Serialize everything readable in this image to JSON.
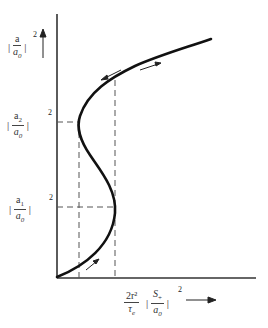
{
  "diagram": {
    "type": "bistability-hysteresis-curve",
    "y_axis_label": {
      "num": "a",
      "den": "a0",
      "den_base": "a",
      "den_sub": "0",
      "power": "2"
    },
    "y_ticks": [
      {
        "id": "a2",
        "num_base": "a",
        "num_sub": "2",
        "den_base": "a",
        "den_sub": "0",
        "power": "2"
      },
      {
        "id": "a1",
        "num_base": "a",
        "num_sub": "1",
        "den_base": "a",
        "den_sub": "0",
        "power": "2"
      }
    ],
    "x_axis_label": {
      "coef_num": "2r²",
      "coef_den_base": "τ",
      "coef_den_sub": "e",
      "frac_num_base": "S",
      "frac_num_sub": "+",
      "frac_den_base": "a",
      "frac_den_sub": "0",
      "power": "2"
    },
    "colors": {
      "curve": "#111111",
      "axis": "#333333",
      "dashed": "#555555",
      "text": "#333333"
    }
  }
}
